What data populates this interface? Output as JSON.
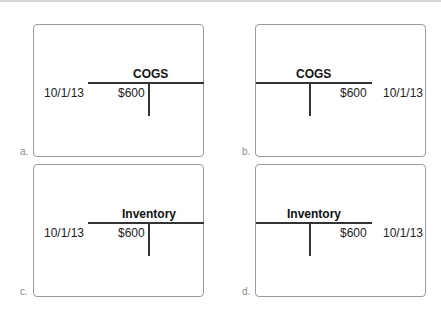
{
  "options": [
    {
      "letter": "a.",
      "account": "COGS",
      "date": "10/1/13",
      "amount": "$600",
      "side": "debit"
    },
    {
      "letter": "b.",
      "account": "COGS",
      "date": "10/1/13",
      "amount": "$600",
      "side": "credit"
    },
    {
      "letter": "c.",
      "account": "Inventory",
      "date": "10/1/13",
      "amount": "$600",
      "side": "debit"
    },
    {
      "letter": "d.",
      "account": "Inventory",
      "date": "10/1/13",
      "amount": "$600",
      "side": "credit"
    }
  ]
}
